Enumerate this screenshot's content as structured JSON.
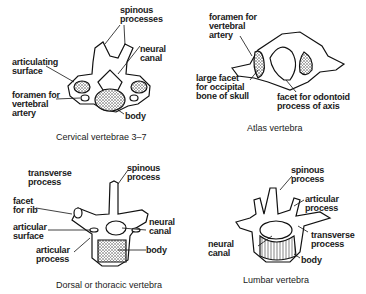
{
  "panels": [
    {
      "caption": "Cervical vertebrae 3–7",
      "labels": {
        "spinous": "spinous\nprocesses",
        "neural": "neural\ncanal",
        "articulating": "articulating\nsurface",
        "foramen": "foramen for\nvertebral\nartery",
        "body": "body"
      }
    },
    {
      "caption": "Atlas vertebra",
      "labels": {
        "foramen": "foramen for\nvertebral\nartery",
        "facet_large": "large facet\nfor occipital\nbone of skull",
        "facet_odontoid": "facet for odontoid\nprocess of axis"
      }
    },
    {
      "caption": "Dorsal or thoracic vertebra",
      "labels": {
        "transverse": "transverse\nprocess",
        "spinous": "spinous\nprocess",
        "facet_rib": "facet\nfor rib",
        "articular_surface": "articular\nsurface",
        "neural": "neural\ncanal",
        "articular_process": "articular\nprocess",
        "body": "body"
      }
    },
    {
      "caption": "Lumbar vertebra",
      "labels": {
        "spinous": "spinous\nprocess",
        "articular": "articular\nprocess",
        "neural": "neural\ncanal",
        "transverse": "transverse\nprocess",
        "body": "body"
      }
    }
  ]
}
